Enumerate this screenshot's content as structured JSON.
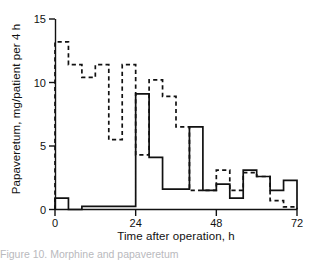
{
  "figure": {
    "title": "",
    "caption_partial": "Figure 10. Morphine and papaveretum"
  },
  "axes": {
    "y_label": "Papaveretum, mg/patient per 4 h",
    "x_label": "Time after operation, h",
    "y_ticks": [
      0,
      5,
      10,
      15
    ],
    "x_ticks": [
      0,
      24,
      48,
      72
    ],
    "y_tick_labels": [
      "0",
      "5",
      "10",
      "15"
    ],
    "x_tick_labels": [
      "0",
      "24",
      "48",
      "72"
    ]
  },
  "colors": {
    "ink": "#111111",
    "background": "#ffffff"
  },
  "chart_data": {
    "type": "line",
    "title": "",
    "xlabel": "Time after operation, h",
    "ylabel": "Papaveretum, mg/patient per 4 h",
    "xlim": [
      0,
      72
    ],
    "ylim": [
      0,
      15
    ],
    "grid": false,
    "legend": "none",
    "bin_width_h": 4,
    "x_bin_starts": [
      0,
      4,
      8,
      12,
      16,
      20,
      24,
      28,
      32,
      36,
      40,
      44,
      48,
      52,
      56,
      60,
      64,
      68
    ],
    "series": [
      {
        "name": "solid",
        "style": "solid",
        "values": [
          0.9,
          0.0,
          0.25,
          0.25,
          0.25,
          0.25,
          9.1,
          4.1,
          1.6,
          1.6,
          6.5,
          1.5,
          2.0,
          0.9,
          3.1,
          2.6,
          1.5,
          2.3
        ]
      },
      {
        "name": "dashed",
        "style": "dashed",
        "values": [
          13.2,
          11.4,
          10.4,
          11.4,
          5.5,
          11.4,
          4.3,
          10.2,
          8.9,
          6.5,
          1.5,
          1.5,
          3.1,
          1.5,
          2.9,
          2.6,
          0.7,
          0.2
        ]
      }
    ]
  }
}
